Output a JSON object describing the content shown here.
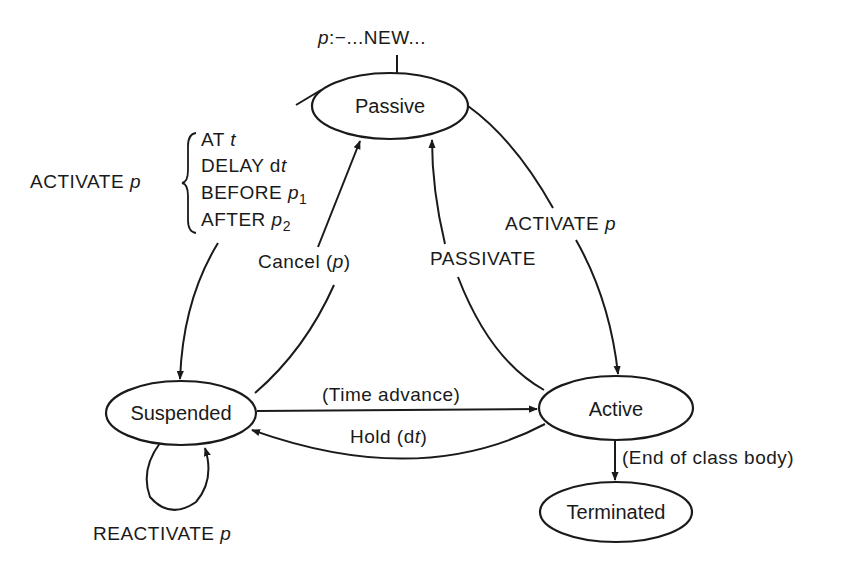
{
  "diagram": {
    "type": "state-transition",
    "entry": {
      "var": "p",
      "text": ":−...NEW..."
    },
    "nodes": {
      "passive": "Passive",
      "suspended": "Suspended",
      "active": "Active",
      "terminated": "Terminated"
    },
    "edges": {
      "activate_left": {
        "prefix": "ACTIVATE ",
        "var": "p",
        "options": [
          {
            "kw": "AT ",
            "arg": "t",
            "sub": ""
          },
          {
            "kw": "DELAY d",
            "arg": "t",
            "sub": ""
          },
          {
            "kw": "BEFORE ",
            "arg": "p",
            "sub": "1"
          },
          {
            "kw": "AFTER ",
            "arg": "p",
            "sub": "2"
          }
        ]
      },
      "cancel": {
        "text": "Cancel (",
        "var": "p",
        "close": ")"
      },
      "passivate": {
        "text": "PASSIVATE"
      },
      "activate_right": {
        "text": "ACTIVATE ",
        "var": "p"
      },
      "time_advance": {
        "text": "(Time advance)"
      },
      "hold": {
        "text": "Hold (d",
        "var": "t",
        "close": ")"
      },
      "end_of_class": {
        "text": "(End of class body)"
      },
      "reactivate": {
        "text": "REACTIVATE ",
        "var": "p"
      }
    },
    "colors": {
      "stroke": "#1a1a1a",
      "background": "#ffffff"
    }
  }
}
